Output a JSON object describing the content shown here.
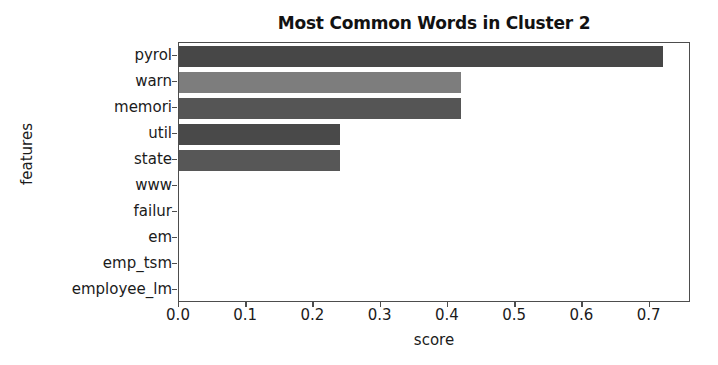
{
  "chart_data": {
    "type": "bar",
    "orientation": "horizontal",
    "title": "Most Common Words in Cluster 2",
    "xlabel": "score",
    "ylabel": "features",
    "categories": [
      "pyrol",
      "warn",
      "memori",
      "util",
      "state",
      "www",
      "failur",
      "em",
      "emp_tsm",
      "employee_lm"
    ],
    "values": [
      0.72,
      0.42,
      0.42,
      0.24,
      0.24,
      0.0,
      0.0,
      0.0,
      0.0,
      0.0
    ],
    "bar_colors": [
      "#474747",
      "#7d7d7d",
      "#555555",
      "#494949",
      "#575757",
      "#555555",
      "#555555",
      "#555555",
      "#555555",
      "#555555"
    ],
    "xticks": [
      "0.0",
      "0.1",
      "0.2",
      "0.3",
      "0.4",
      "0.5",
      "0.6",
      "0.7"
    ],
    "xtick_values": [
      0.0,
      0.1,
      0.2,
      0.3,
      0.4,
      0.5,
      0.6,
      0.7
    ],
    "xlim": [
      0.0,
      0.7614
    ],
    "grid": false,
    "legend": null,
    "axis_color": "#4d4d4d",
    "background": "#ffffff"
  }
}
